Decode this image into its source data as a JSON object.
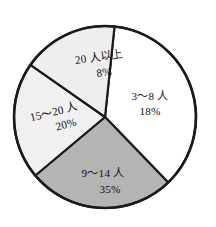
{
  "chart_data": {
    "type": "pie",
    "title": "",
    "subtitle": "",
    "xlabel": "",
    "ylabel": "",
    "legend_position": "none",
    "grid": false,
    "unit": "%",
    "categories": [
      "3〜8 人",
      "9〜14 人",
      "15〜20 人",
      "20 人以上"
    ],
    "values": [
      18,
      35,
      20,
      8
    ],
    "slices": [
      {
        "label": "3〜8 人",
        "percent_text": "18%",
        "value": 18,
        "color": "#ffffff",
        "start_angle": 6,
        "end_angle": 136,
        "label_x": 150,
        "label_y": 97,
        "pct_x": 150,
        "pct_y": 112,
        "text_anchor": "middle",
        "rotate": 0
      },
      {
        "label": "9〜14 人",
        "percent_text": "35%",
        "value": 35,
        "color": "#b4b4b4",
        "start_angle": 136,
        "end_angle": 230,
        "label_x": 103,
        "label_y": 174,
        "pct_x": 110,
        "pct_y": 190,
        "text_anchor": "middle",
        "rotate": 0
      },
      {
        "label": "15〜20 人",
        "percent_text": "20%",
        "value": 20,
        "color": "#f0f0f0",
        "start_angle": 230,
        "end_angle": 305,
        "label_x": 54,
        "label_y": 113,
        "pct_x": 63,
        "pct_y": 128,
        "text_anchor": "middle",
        "rotate": -14
      },
      {
        "label": "20 人以上",
        "percent_text": "8%",
        "value": 8,
        "color": "#eeeeee",
        "start_angle": 305,
        "end_angle": 366,
        "label_x": 99,
        "label_y": 58,
        "pct_x": 102,
        "pct_y": 74,
        "text_anchor": "middle",
        "rotate": -8
      }
    ],
    "geometry": {
      "center_x": 105,
      "center_y": 117,
      "radius": 91
    },
    "colors": {
      "outline": "#1a1a1a",
      "background": "#ffffff",
      "slice_white": "#ffffff",
      "slice_light": "#f0f0f0",
      "slice_medium": "#b4b4b4"
    }
  }
}
